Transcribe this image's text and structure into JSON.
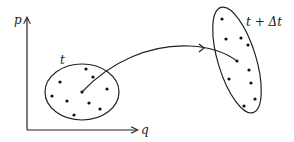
{
  "diagram": {
    "axes": {
      "y_label": "p",
      "x_label": "q"
    },
    "initial_region": {
      "label": "t",
      "dots": [
        [
          86,
          69
        ],
        [
          93,
          77
        ],
        [
          60,
          82
        ],
        [
          107,
          89
        ],
        [
          82,
          92
        ],
        [
          52,
          96
        ],
        [
          67,
          101
        ],
        [
          89,
          103
        ],
        [
          100,
          109
        ],
        [
          74,
          115
        ]
      ]
    },
    "final_region": {
      "label": "t + Δt",
      "dots": [
        [
          222,
          19
        ],
        [
          226,
          39
        ],
        [
          241,
          38
        ],
        [
          248,
          45
        ],
        [
          237,
          61
        ],
        [
          249,
          70
        ],
        [
          229,
          79
        ],
        [
          251,
          83
        ],
        [
          255,
          99
        ],
        [
          244,
          106
        ]
      ]
    },
    "trajectory": {
      "from": "initial_region center",
      "to": "final_region point",
      "arrow": true
    },
    "colors": {
      "stroke": "#222222",
      "background": "#ffffff"
    }
  }
}
